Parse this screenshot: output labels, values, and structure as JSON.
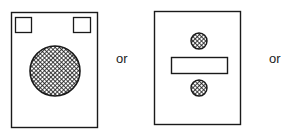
{
  "diagram": {
    "panels": [
      {
        "name": "panel-one-large-circle",
        "elements": [
          "two small squares at top corners",
          "large cross-hatched circle"
        ]
      },
      {
        "name": "panel-two-dots-and-bar",
        "elements": [
          "small hatched dot",
          "horizontal bar",
          "small hatched dot"
        ]
      }
    ],
    "separators": [
      "or",
      "or"
    ],
    "colors": {
      "stroke": "#1a1a1a",
      "background": "#ffffff"
    }
  }
}
